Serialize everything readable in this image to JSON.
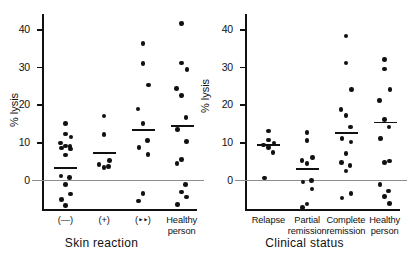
{
  "figure": {
    "background": "#ffffff",
    "ink_color": "#111111",
    "zero_line_color": "#8d8d8d"
  },
  "chart_data": [
    {
      "type": "scatter",
      "panel": "left",
      "title": "Skin reaction",
      "xlabel": "Skin reaction",
      "ylabel": "% lysis",
      "ylim": [
        -8,
        44
      ],
      "yticks": [
        0,
        10,
        20,
        30,
        40
      ],
      "ytick_labels": [
        "0",
        "10",
        "20",
        "30",
        "40"
      ],
      "grid": false,
      "legend": "none",
      "zero_reference_line": 0,
      "categories": [
        "(−)",
        "(+)",
        "(‣‣)",
        "Healthy person"
      ],
      "groups": [
        {
          "label": "(−)",
          "mean": 3.2,
          "values": [
            15.0,
            12.2,
            11.4,
            9.8,
            9.0,
            8.8,
            8.4,
            8.2,
            6.6,
            1.0,
            0.6,
            -1.2,
            -3.8,
            -5.2,
            -6.8
          ]
        },
        {
          "label": "(+)",
          "mean": 7.2,
          "values": [
            16.9,
            12.0,
            5.2,
            4.0,
            3.2,
            3.5
          ]
        },
        {
          "label": "(‣‣)",
          "mean": 13.2,
          "values": [
            36.2,
            30.8,
            25.2,
            18.8,
            15.0,
            10.4,
            8.6,
            6.8,
            -3.6,
            -5.6
          ]
        },
        {
          "label": "Healthy person",
          "mean": 14.3,
          "values": [
            41.5,
            31.0,
            29.2,
            24.3,
            22.4,
            16.5,
            13.4,
            10.2,
            5.4,
            4.3,
            -1.2,
            -3.2,
            -4.6,
            -6.6
          ]
        }
      ]
    },
    {
      "type": "scatter",
      "panel": "right",
      "title": "Clinical status",
      "xlabel": "Clinical status",
      "ylabel": "% lysis",
      "ylim": [
        -8,
        44
      ],
      "yticks": [
        0,
        10,
        20,
        30,
        40
      ],
      "ytick_labels": [
        "0",
        "10",
        "20",
        "30",
        "40"
      ],
      "grid": false,
      "legend": "none",
      "zero_reference_line": 0,
      "categories": [
        "Relapse",
        "Partial remission",
        "Complete remission",
        "Healthy person"
      ],
      "groups": [
        {
          "label": "Relapse",
          "mean": 9.2,
          "values": [
            13.0,
            10.6,
            9.8,
            9.2,
            8.6,
            7.2,
            0.5
          ]
        },
        {
          "label": "Partial remission",
          "mean": 2.8,
          "values": [
            12.6,
            10.4,
            6.0,
            5.2,
            4.3,
            -0.2,
            -0.6,
            -2.4,
            -6.4,
            -7.4
          ]
        },
        {
          "label": "Complete remission",
          "mean": 12.5,
          "values": [
            38.2,
            31.0,
            24.0,
            18.6,
            17.0,
            14.0,
            11.0,
            10.0,
            7.0,
            4.6,
            3.8,
            2.4,
            -3.6,
            -4.8
          ]
        },
        {
          "label": "Healthy person",
          "mean": 15.2,
          "values": [
            32.0,
            29.4,
            24.0,
            21.0,
            16.0,
            14.0,
            11.0,
            5.0,
            4.6,
            -1.2,
            -3.0,
            -4.4,
            -6.2
          ]
        }
      ]
    }
  ],
  "panels": {
    "left": {
      "name": "skin-reaction-panel",
      "ylabel": "% lysis",
      "title": "Skin reaction",
      "ytick_labels": [
        "0",
        "10",
        "20",
        "30",
        "40"
      ],
      "category_labels": [
        "(—)",
        "(+)",
        "(‣‣)",
        "Healthy person"
      ]
    },
    "right": {
      "name": "clinical-status-panel",
      "ylabel": "% lysis",
      "title": "Clinical status",
      "ytick_labels": [
        "0",
        "10",
        "20",
        "30",
        "40"
      ],
      "category_labels": [
        "Relapse",
        "Partial\nremission",
        "Complete\nremission",
        "Healthy\nperson"
      ]
    }
  }
}
